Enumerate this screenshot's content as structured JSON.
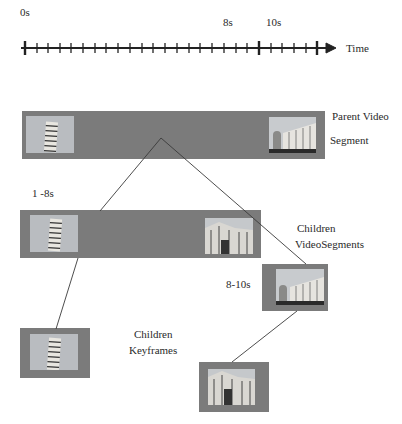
{
  "timeline": {
    "labels": [
      {
        "text": "0s",
        "x": 20,
        "y": 16
      },
      {
        "text": "8s",
        "x": 223,
        "y": 16
      },
      {
        "text": "10s",
        "x": 266,
        "y": 16
      }
    ],
    "axis_label": "Time",
    "major_ticks_at": [
      "0s",
      "10s",
      "end"
    ]
  },
  "parent": {
    "label_line1": "Parent Video",
    "label_line2": "Segment",
    "left_thumb": "leaning-tower-image",
    "right_thumb": "cathedral-square-image"
  },
  "children_segments": {
    "label_line1": "Children",
    "label_line2": "VideoSegments",
    "segment1": {
      "range": "1 -8s",
      "left_thumb": "leaning-tower-image",
      "right_thumb": "cathedral-closeup-image"
    },
    "segment2": {
      "range": "8-10s",
      "thumb": "cathedral-square-image"
    }
  },
  "children_keyframes": {
    "label_line1": "Children",
    "label_line2": "Keyframes",
    "keyframe1": "leaning-tower-image",
    "keyframe2": "cathedral-closeup-image"
  },
  "colors": {
    "segment_fill": "#7b7b7b",
    "line": "#333333",
    "thumb_sky": "#c4c7cb"
  }
}
